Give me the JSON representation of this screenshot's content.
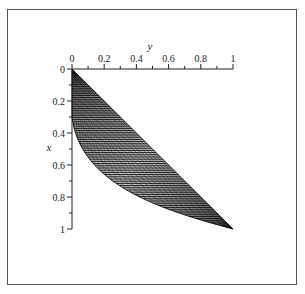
{
  "chart_data": {
    "type": "area",
    "title": "",
    "xlabel": "y",
    "ylabel": "x",
    "x_axis_position": "top",
    "y_axis_inverted": true,
    "xlim": [
      0,
      1
    ],
    "ylim": [
      0,
      1
    ],
    "x_ticks": [
      "0",
      "0.2",
      "0.4",
      "0.6",
      "0.8",
      "1"
    ],
    "y_ticks": [
      "0",
      "0.2",
      "0.4",
      "0.6",
      "0.8",
      "1"
    ],
    "grid": false,
    "legend": null,
    "upper_boundary": {
      "points_yx": [
        [
          0,
          0
        ],
        [
          0.2,
          0.2
        ],
        [
          0.4,
          0.4
        ],
        [
          0.6,
          0.6
        ],
        [
          0.8,
          0.8
        ],
        [
          1,
          1
        ]
      ]
    },
    "lower_boundary": {
      "points_yx": [
        [
          0,
          0
        ],
        [
          0.0,
          0.2
        ],
        [
          0.02,
          0.4
        ],
        [
          0.1,
          0.55
        ],
        [
          0.3,
          0.7
        ],
        [
          0.6,
          0.85
        ],
        [
          1,
          1
        ]
      ]
    },
    "series": [
      {
        "name": "hatched-region",
        "color": "#000000"
      }
    ]
  },
  "labels": {
    "x_axis_title": "y",
    "y_axis_title": "x",
    "x_tick_labels": [
      "0",
      "0.2",
      "0.4",
      "0.6",
      "0.8",
      "1"
    ],
    "y_tick_labels": [
      "0",
      "0.2",
      "0.4",
      "0.6",
      "0.8",
      "1"
    ]
  }
}
